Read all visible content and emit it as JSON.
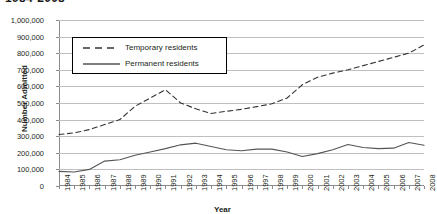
{
  "chart_data": {
    "type": "line",
    "title": "1984-2008",
    "xlabel": "Year",
    "ylabel": "Number Admitted",
    "ylim": [
      0,
      1000000
    ],
    "ytick_labels": [
      "1,000,000",
      "900,000",
      "800,000",
      "700,000",
      "600,000",
      "500,000",
      "400,000",
      "300,000",
      "200,000",
      "100,000",
      "0"
    ],
    "ytick_values": [
      1000000,
      900000,
      800000,
      700000,
      600000,
      500000,
      400000,
      300000,
      200000,
      100000,
      0
    ],
    "grid": true,
    "legend_position": "upper-left-inside",
    "categories": [
      "1984",
      "1985",
      "1986",
      "1987",
      "1988",
      "1989",
      "1990",
      "1991",
      "1992",
      "1993",
      "1994",
      "1995",
      "1996",
      "1997",
      "1998",
      "1999",
      "2000",
      "2001",
      "2002",
      "2003",
      "2004",
      "2005",
      "2006",
      "2007",
      "2008"
    ],
    "series": [
      {
        "name": "Temporary residents",
        "style": "dashed",
        "color": "#333333",
        "values": [
          310000,
          320000,
          340000,
          370000,
          400000,
          480000,
          530000,
          580000,
          500000,
          465000,
          437000,
          450000,
          462000,
          478000,
          495000,
          530000,
          610000,
          655000,
          680000,
          700000,
          725000,
          750000,
          775000,
          800000,
          850000
        ]
      },
      {
        "name": "Permanent residents",
        "style": "solid",
        "color": "#555555",
        "values": [
          88000,
          84000,
          100000,
          150000,
          158000,
          185000,
          205000,
          225000,
          248000,
          258000,
          238000,
          218000,
          212000,
          222000,
          222000,
          205000,
          178000,
          195000,
          218000,
          250000,
          232000,
          225000,
          228000,
          262000,
          245000
        ]
      }
    ]
  }
}
